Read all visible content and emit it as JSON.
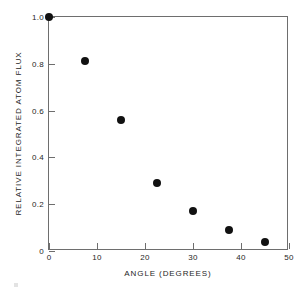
{
  "chart_data": {
    "type": "scatter",
    "title": "",
    "xlabel": "ANGLE (DEGREES)",
    "ylabel": "RELATIVE INTEGRATED ATOM FLUX",
    "xlim": [
      0,
      50
    ],
    "ylim": [
      0,
      1.0
    ],
    "grid": false,
    "legend": null,
    "xticks": [
      0,
      10,
      20,
      30,
      40,
      50
    ],
    "xtick_labels": [
      "0",
      "10",
      "20",
      "30",
      "40",
      "50"
    ],
    "yticks": [
      0,
      0.2,
      0.4,
      0.6,
      0.8,
      1.0
    ],
    "ytick_labels": [
      "0",
      "0.2",
      "0.4",
      "0.6",
      "0.8",
      "1.0"
    ],
    "marker": "filled-circle",
    "marker_color": "#111111",
    "series": [
      {
        "name": "Relative integrated atom flux",
        "points": [
          {
            "x": 0.0,
            "y": 1.0
          },
          {
            "x": 7.5,
            "y": 0.81
          },
          {
            "x": 15.0,
            "y": 0.56
          },
          {
            "x": 22.5,
            "y": 0.29
          },
          {
            "x": 30.0,
            "y": 0.17
          },
          {
            "x": 37.5,
            "y": 0.09
          },
          {
            "x": 45.0,
            "y": 0.04
          }
        ]
      }
    ]
  },
  "figure": {
    "background_color": "#ffffff",
    "axis_color": "#6e6e6e"
  }
}
